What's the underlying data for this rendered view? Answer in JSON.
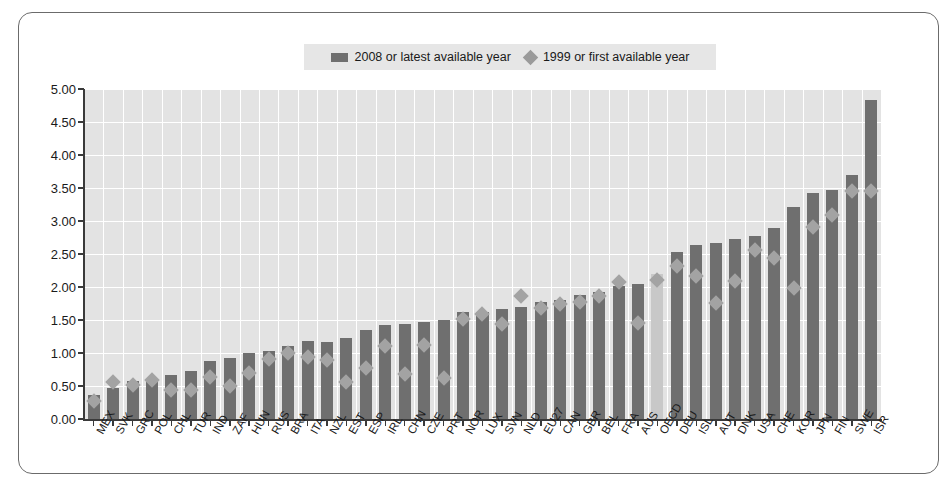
{
  "legend": {
    "items": [
      {
        "label": "2008 or latest available year",
        "marker": "bar-swatch-icon",
        "color": "#6f6f6f"
      },
      {
        "label": "1999 or first available year",
        "marker": "diamond-marker-icon",
        "color": "#9a9a9a"
      }
    ]
  },
  "colors": {
    "bar": "#6f6f6f",
    "bar_highlight": "#c8c8c8",
    "diamond": "#a3a3a3",
    "plot_background": "#e3e3e3",
    "gridline": "#ffffff",
    "axis": "#3a3a3a",
    "legend_background": "#e6e6e6"
  },
  "chart_data": {
    "type": "bar",
    "title": "",
    "subtitle": "",
    "xlabel": "",
    "ylabel": "",
    "ylim": [
      0,
      5
    ],
    "ytick_step": 0.5,
    "ytick_labels": [
      "0.00",
      "0.50",
      "1.00",
      "1.50",
      "2.00",
      "2.50",
      "3.00",
      "3.50",
      "4.00",
      "4.50",
      "5.00"
    ],
    "grid": true,
    "legend_position": "top-center",
    "highlight_category": "OECD",
    "categories": [
      "MEX",
      "SVK",
      "GRC",
      "POL",
      "CHL",
      "TUR",
      "IND",
      "ZAF",
      "HUN",
      "RUS",
      "BRA",
      "ITA",
      "NZL",
      "EST",
      "ESP",
      "IRL",
      "CHN",
      "CZE",
      "PRT",
      "NOR",
      "LUX",
      "SVN",
      "NLD",
      "EU27",
      "CAN",
      "GBR",
      "BEL",
      "FRA",
      "AUS",
      "OECD",
      "DEU",
      "ISL",
      "AUT",
      "DNK",
      "USA",
      "CHE",
      "KOR",
      "JPN",
      "FIN",
      "SWE",
      "ISR"
    ],
    "series": [
      {
        "name": "2008 or latest available year",
        "type": "bar",
        "values": [
          0.37,
          0.47,
          0.58,
          0.61,
          0.67,
          0.72,
          0.88,
          0.93,
          1.0,
          1.03,
          1.11,
          1.18,
          1.17,
          1.23,
          1.35,
          1.43,
          1.44,
          1.47,
          1.5,
          1.62,
          1.62,
          1.66,
          1.7,
          1.77,
          1.8,
          1.88,
          1.92,
          2.02,
          2.05,
          2.19,
          2.53,
          2.64,
          2.66,
          2.72,
          2.77,
          2.9,
          3.21,
          3.42,
          3.47,
          3.7,
          4.83
        ]
      },
      {
        "name": "1999 or first available year",
        "type": "scatter",
        "marker": "diamond",
        "values": [
          0.35,
          0.65,
          0.6,
          0.68,
          0.52,
          0.52,
          0.72,
          0.58,
          0.78,
          0.99,
          1.08,
          1.02,
          0.97,
          0.64,
          0.86,
          1.19,
          0.76,
          1.2,
          0.71,
          1.6,
          1.67,
          1.53,
          1.95,
          1.76,
          1.82,
          1.85,
          1.94,
          2.16,
          1.54,
          2.19,
          2.4,
          2.25,
          1.84,
          2.18,
          2.64,
          2.53,
          2.07,
          3.0,
          3.17,
          3.54,
          3.54
        ]
      }
    ]
  }
}
